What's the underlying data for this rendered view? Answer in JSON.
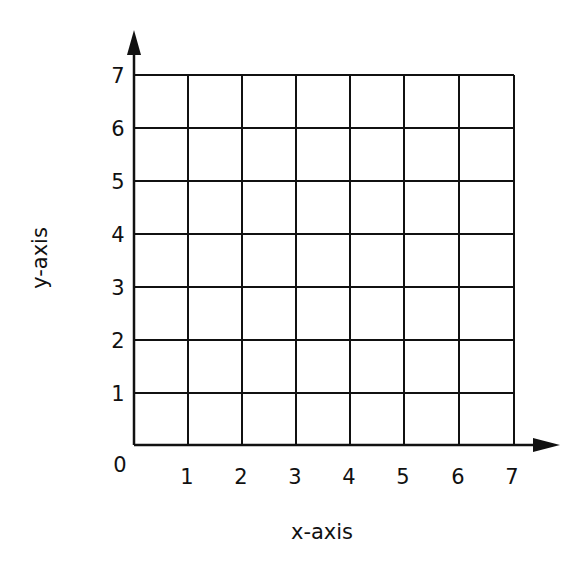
{
  "diagram": {
    "type": "coordinate-grid",
    "x_axis": {
      "label": "x-axis",
      "ticks": [
        "1",
        "2",
        "3",
        "4",
        "5",
        "6",
        "7"
      ],
      "min": 0,
      "max": 7
    },
    "y_axis": {
      "label": "y-axis",
      "ticks": [
        "1",
        "2",
        "3",
        "4",
        "5",
        "6",
        "7"
      ],
      "min": 0,
      "max": 7
    },
    "origin_label": "0",
    "grid": {
      "columns": 7,
      "rows": 7,
      "line_color": "#111111",
      "background": "#ffffff"
    }
  }
}
